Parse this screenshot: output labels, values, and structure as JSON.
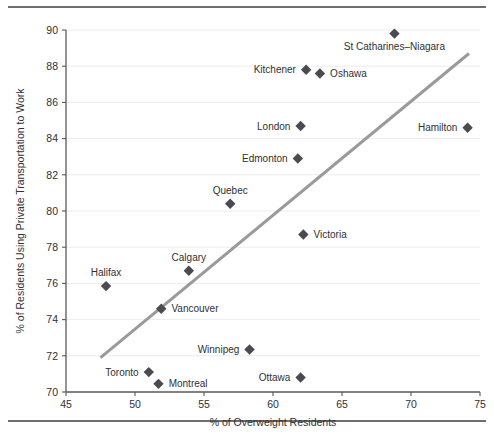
{
  "chart_data": {
    "type": "scatter",
    "title": "",
    "xlabel": "% of Overweight Residents",
    "ylabel": "% of Residents Using Private Transportation to Work",
    "xlim": [
      45,
      75
    ],
    "ylim": [
      70,
      90
    ],
    "xticks": [
      45,
      50,
      55,
      60,
      65,
      70,
      75
    ],
    "yticks": [
      70,
      72,
      74,
      76,
      78,
      80,
      82,
      84,
      86,
      88,
      90
    ],
    "grid": "horizontal",
    "legend": "none",
    "marker_shape": "diamond",
    "marker_color": "#4a4a50",
    "trendline": {
      "label": "regression line",
      "color": "#9a9a9e",
      "x": [
        47.5,
        74.2
      ],
      "y": [
        71.9,
        88.7
      ]
    },
    "points": [
      {
        "name": "St Catharines–Niagara",
        "x": 68.8,
        "y": 89.8,
        "label_pos": "below"
      },
      {
        "name": "Kitchener",
        "x": 62.4,
        "y": 87.8,
        "label_pos": "left"
      },
      {
        "name": "Oshawa",
        "x": 63.4,
        "y": 87.6,
        "label_pos": "right"
      },
      {
        "name": "Hamilton",
        "x": 74.1,
        "y": 84.6,
        "label_pos": "left"
      },
      {
        "name": "London",
        "x": 62.0,
        "y": 84.7,
        "label_pos": "left"
      },
      {
        "name": "Edmonton",
        "x": 61.8,
        "y": 82.9,
        "label_pos": "left"
      },
      {
        "name": "Quebec",
        "x": 56.9,
        "y": 80.4,
        "label_pos": "above"
      },
      {
        "name": "Victoria",
        "x": 62.2,
        "y": 78.7,
        "label_pos": "right"
      },
      {
        "name": "Calgary",
        "x": 53.9,
        "y": 76.7,
        "label_pos": "above"
      },
      {
        "name": "Halifax",
        "x": 47.9,
        "y": 75.85,
        "label_pos": "above"
      },
      {
        "name": "Vancouver",
        "x": 51.9,
        "y": 74.6,
        "label_pos": "right"
      },
      {
        "name": "Winnipeg",
        "x": 58.3,
        "y": 72.35,
        "label_pos": "left"
      },
      {
        "name": "Toronto",
        "x": 51.0,
        "y": 71.1,
        "label_pos": "left"
      },
      {
        "name": "Montreal",
        "x": 51.7,
        "y": 70.45,
        "label_pos": "right"
      },
      {
        "name": "Ottawa",
        "x": 62.0,
        "y": 70.8,
        "label_pos": "left"
      }
    ]
  },
  "figure": {
    "caption": ""
  }
}
